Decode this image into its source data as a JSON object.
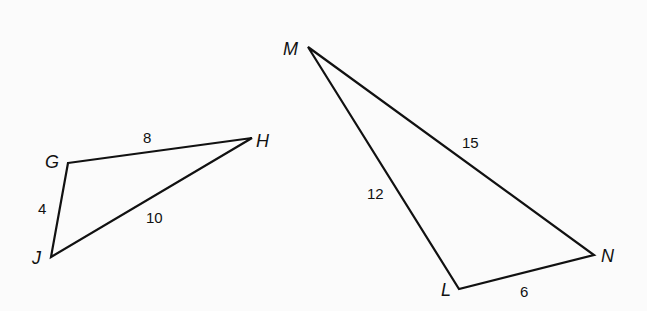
{
  "triangles": [
    {
      "name": "GHJ",
      "vertices": {
        "G": "G",
        "H": "H",
        "J": "J"
      },
      "sides": {
        "GH": "8",
        "GJ": "4",
        "HJ": "10"
      }
    },
    {
      "name": "LMN",
      "vertices": {
        "M": "M",
        "N": "N",
        "L": "L"
      },
      "sides": {
        "ML": "12",
        "MN": "15",
        "LN": "6"
      }
    }
  ]
}
